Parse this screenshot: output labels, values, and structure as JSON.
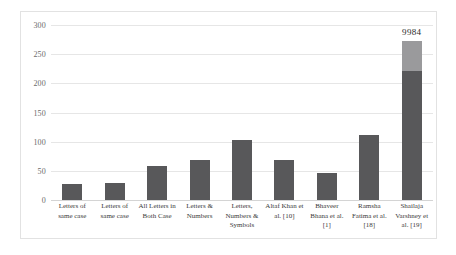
{
  "chart_data": {
    "type": "bar",
    "title": "",
    "subtitle": "",
    "xlabel": "",
    "ylabel": "",
    "ylim": [
      0,
      300
    ],
    "yticks": [
      0,
      50,
      100,
      150,
      200,
      250,
      300
    ],
    "grid": true,
    "legend": "none",
    "categories": [
      "Letters of same case",
      "Letters of same case",
      "All Letters in Both Case",
      "Letters & Numbers",
      "Letters, Numbers & Symbols",
      "Altaf Khan et al. [10]",
      "Bhaveer Bhana et al. [1]",
      "Ramsha Fatima et al. [18]",
      "Shailaja Varshney et al. [19]"
    ],
    "values": [
      27,
      29,
      58,
      68,
      103,
      69,
      46,
      111,
      272
    ],
    "bar_labels": [
      "",
      "",
      "",
      "",
      "",
      "",
      "",
      "",
      "9984"
    ],
    "stacked_last_bar": {
      "lower_value": 222,
      "upper_value": 50,
      "lower_color": "#58585a",
      "upper_color": "#9a9a9c"
    },
    "bar_color": "#58585a",
    "gridline_color": "#e6e6e6"
  },
  "axis": {
    "y_tick_labels": [
      "300",
      "250",
      "200",
      "150",
      "100",
      "50",
      "0"
    ]
  }
}
